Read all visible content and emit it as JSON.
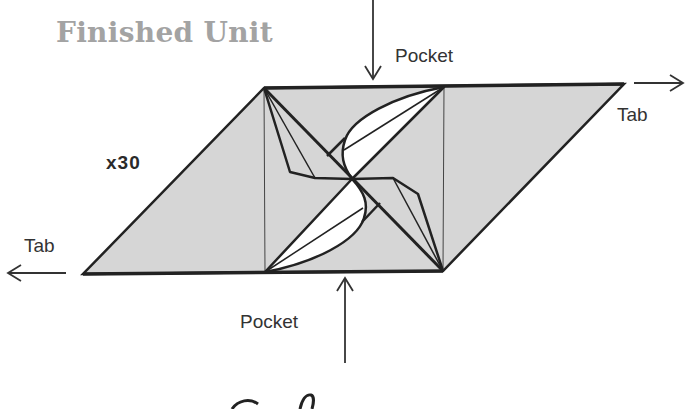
{
  "title": "Finished Unit",
  "multiplier": "x30",
  "labels": {
    "pocket_top": "Pocket",
    "pocket_bottom": "Pocket",
    "tab_right": "Tab",
    "tab_left": "Tab"
  },
  "colors": {
    "paper_fill": "#d6d6d6",
    "stroke": "#222222",
    "flap_fill": "#ffffff",
    "title": "#a3a3a3"
  },
  "geometry": {
    "parallelogram": [
      [
        264,
        88
      ],
      [
        624,
        84
      ],
      [
        443,
        271
      ],
      [
        83,
        274
      ]
    ],
    "inner_square": [
      [
        264,
        88
      ],
      [
        444,
        86
      ],
      [
        443,
        271
      ],
      [
        265,
        272
      ]
    ],
    "center": [
      352,
      179
    ]
  }
}
